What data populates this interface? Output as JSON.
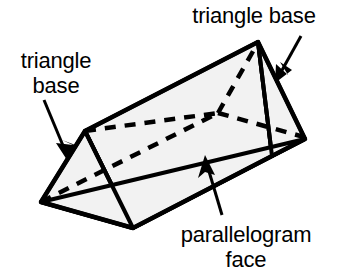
{
  "figure": {
    "background_color": "#ffffff",
    "stroke_color": "#000000",
    "face_fill_color": "#f2f2f2"
  },
  "labels": {
    "triangle_base_left": "triangle\nbase",
    "triangle_base_top": "triangle base",
    "parallelogram_face": "parallelogram\nface"
  },
  "icons": {
    "leader_arrow_left": "arrow-icon",
    "leader_arrow_top_right": "arrow-icon",
    "leader_arrow_bottom": "arrow-icon"
  },
  "geometry": {
    "visible_vertices": {
      "left_apex": [
        85,
        131
      ],
      "left_far": [
        41,
        202
      ],
      "bottom_front": [
        133,
        228
      ],
      "right_apex": [
        258,
        42
      ],
      "right_far": [
        305,
        139
      ],
      "right_bottom_front": [
        272,
        156
      ]
    },
    "hidden_vertex": [
      218,
      113
    ],
    "hidden_edges": [
      [
        [
          41,
          202
        ],
        [
          218,
          113
        ]
      ],
      [
        [
          85,
          131
        ],
        [
          218,
          113
        ]
      ],
      [
        [
          218,
          113
        ],
        [
          305,
          139
        ]
      ]
    ]
  }
}
